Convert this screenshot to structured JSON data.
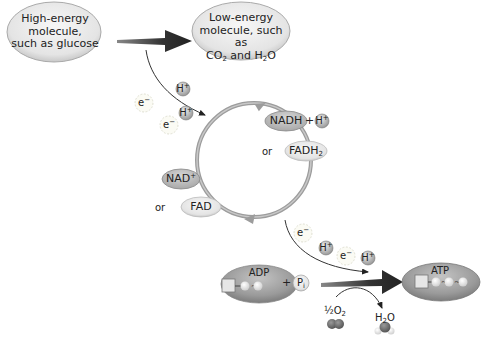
{
  "diagram": {
    "high_energy": {
      "line1": "High-energy",
      "line2": "molecule,",
      "line3": "such as glucose"
    },
    "low_energy": {
      "line1": "Low-energy",
      "line2": "molecule, such as",
      "line3_a": "CO",
      "line3_sub": "2",
      "line3_b": " and H",
      "line3_sub2": "2",
      "line3_c": "O"
    },
    "cycle": {
      "nadh": "NADH",
      "plus": "+",
      "or_top": "or",
      "fadh2": "FADH",
      "fadh2_sub": "2",
      "nad": "NAD",
      "nad_sup": "+",
      "or_bottom": "or",
      "fad": "FAD"
    },
    "particles": {
      "h_plus": "H",
      "h_sup": "+",
      "e_minus": "e",
      "e_sup": "−"
    },
    "atp_synthesis": {
      "adp": "ADP",
      "plus": "+",
      "pi": "P",
      "pi_sub": "i",
      "atp": "ATP",
      "half_o2": "½O",
      "half_o2_sub": "2",
      "h2o_a": "H",
      "h2o_sub": "2",
      "h2o_b": "O"
    },
    "colors": {
      "oval_light": "#ececec",
      "oval_dark": "#9a9a9a",
      "arrow": "#3a3a3a",
      "cycle": "#9c9c9c",
      "h_ball": "#b5b5b5"
    }
  }
}
